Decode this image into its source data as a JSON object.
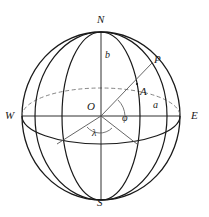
{
  "figure": {
    "kind": "geodetic-ellipsoid-diagram",
    "colors": {
      "background": "#ffffff",
      "stroke": "#1a1a1a",
      "thin_stroke": "#555555",
      "dashed_stroke": "#777777",
      "label": "#1a1a1a"
    },
    "stroke_widths": {
      "outline": 1.3,
      "meridian": 1.2,
      "equator": 1.2,
      "ray": 0.9,
      "axis": 0.9,
      "dashed": 0.9
    }
  },
  "labels": {
    "north": "N",
    "south": "S",
    "west": "W",
    "east": "E",
    "center": "O",
    "point_surface": "A",
    "point_outer": "P",
    "semi_minor_axis": "b",
    "semi_major_axis": "a",
    "longitude_angle": "λ",
    "latitude_angle": "φ"
  },
  "geometry": {
    "center": {
      "x": 101,
      "y": 116
    },
    "radius_x": 79,
    "radius_y": 84,
    "pole_north": {
      "x": 101,
      "y": 32
    },
    "pole_south": {
      "x": 101,
      "y": 200
    },
    "west_point": {
      "x": 22,
      "y": 116
    },
    "east_point": {
      "x": 180,
      "y": 116
    },
    "point_A": {
      "x": 137,
      "y": 84
    },
    "point_P": {
      "x": 152,
      "y": 63
    },
    "equator_ellipse_ry": 28,
    "meridian_front_rx": 39,
    "meridian_oblique_rx": 66,
    "lower_left_foot": {
      "x": 57,
      "y": 144
    },
    "lower_right_foot": {
      "x": 137,
      "y": 144
    }
  },
  "annotations": {
    "lambda_arc_radius": 17,
    "phi_arc_radius": 24,
    "axis_label_b_pos": {
      "x": 107,
      "y": 57
    },
    "axis_label_a_pos": {
      "x": 155,
      "y": 106
    }
  }
}
